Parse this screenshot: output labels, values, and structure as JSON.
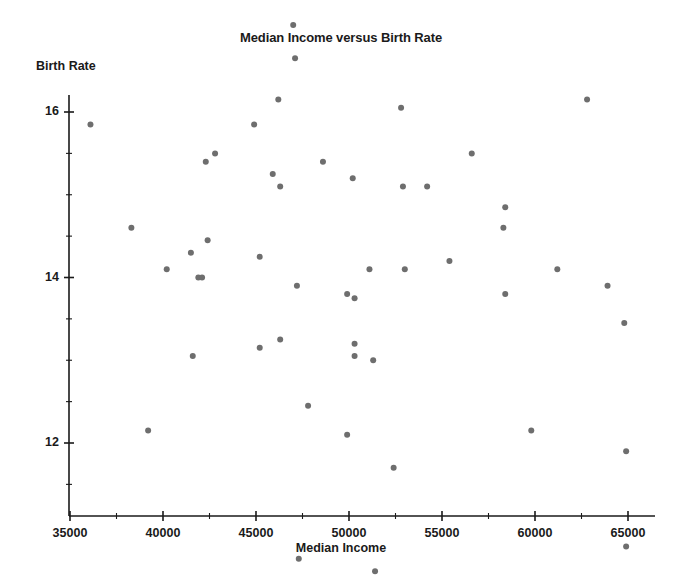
{
  "chart_data": {
    "type": "scatter",
    "title": "Median Income versus Birth Rate",
    "xlabel": "Median Income",
    "ylabel": "Birth Rate",
    "xlim": [
      34200,
      66200
    ],
    "ylim": [
      10.2,
      21.5
    ],
    "xticks": [
      35000,
      40000,
      45000,
      50000,
      55000,
      60000,
      65000
    ],
    "xtick_labels": [
      "35000",
      "40000",
      "45000",
      "50000",
      "55000",
      "60000",
      "65000"
    ],
    "yticks": [
      12,
      14,
      16,
      18,
      20
    ],
    "ytick_labels": [
      "12",
      "14",
      "16",
      "18",
      "20"
    ],
    "y_minor_step": 0.5,
    "grid": false,
    "legend": null,
    "marker": "circle",
    "marker_color": "#6e6e6e",
    "marker_size_px": 6,
    "series": [
      {
        "name": "counties",
        "points": [
          [
            36100,
            15.85
          ],
          [
            38300,
            14.6
          ],
          [
            39200,
            12.15
          ],
          [
            40200,
            14.1
          ],
          [
            41500,
            14.3
          ],
          [
            41600,
            13.05
          ],
          [
            41900,
            14.0
          ],
          [
            42100,
            14.0
          ],
          [
            42300,
            15.4
          ],
          [
            42400,
            14.45
          ],
          [
            42800,
            15.5
          ],
          [
            44900,
            15.85
          ],
          [
            45200,
            14.25
          ],
          [
            45200,
            13.15
          ],
          [
            45900,
            15.25
          ],
          [
            46200,
            16.15
          ],
          [
            46300,
            15.1
          ],
          [
            46300,
            13.25
          ],
          [
            47000,
            17.05
          ],
          [
            47100,
            16.65
          ],
          [
            47200,
            13.9
          ],
          [
            47300,
            10.6
          ],
          [
            47800,
            12.45
          ],
          [
            48600,
            15.4
          ],
          [
            49900,
            13.8
          ],
          [
            49900,
            12.1
          ],
          [
            50200,
            15.2
          ],
          [
            50300,
            13.75
          ],
          [
            50300,
            13.2
          ],
          [
            50300,
            13.05
          ],
          [
            51100,
            14.1
          ],
          [
            51300,
            13.0
          ],
          [
            51400,
            10.45
          ],
          [
            52400,
            11.7
          ],
          [
            52800,
            16.05
          ],
          [
            52900,
            15.1
          ],
          [
            53000,
            14.1
          ],
          [
            54200,
            15.1
          ],
          [
            55400,
            14.2
          ],
          [
            56600,
            15.5
          ],
          [
            58300,
            14.6
          ],
          [
            58400,
            14.85
          ],
          [
            58400,
            13.8
          ],
          [
            59800,
            12.15
          ],
          [
            60400,
            20.8
          ],
          [
            61200,
            14.1
          ],
          [
            62800,
            16.15
          ],
          [
            63900,
            13.9
          ],
          [
            64800,
            13.45
          ],
          [
            64900,
            11.9
          ],
          [
            64900,
            10.75
          ]
        ]
      }
    ]
  },
  "axes_geometry": {
    "left_px": 69,
    "right_px": 655,
    "top_px": 95,
    "bottom_px": 516,
    "x_origin_value": 35000,
    "x_origin_px": 70,
    "x_px_per_unit": 0.0186,
    "y_origin_value": 12,
    "y_origin_px": 443,
    "y_px_per_unit": 82.75
  }
}
